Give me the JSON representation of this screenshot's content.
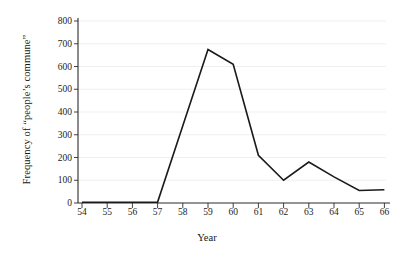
{
  "chart_data": {
    "type": "line",
    "title": "",
    "xlabel": "Year",
    "ylabel": "Frequency of “people’s commune”",
    "x": [
      54,
      55,
      56,
      57,
      58,
      59,
      60,
      61,
      62,
      63,
      64,
      65,
      66
    ],
    "categories": [
      "54",
      "55",
      "56",
      "57",
      "58",
      "59",
      "60",
      "61",
      "62",
      "63",
      "64",
      "65",
      "66"
    ],
    "values": [
      3,
      3,
      3,
      4,
      340,
      675,
      610,
      210,
      100,
      180,
      115,
      55,
      58
    ],
    "series": [
      {
        "name": "Frequency of “people’s commune”",
        "values": [
          3,
          3,
          3,
          4,
          340,
          675,
          610,
          210,
          100,
          180,
          115,
          55,
          58
        ]
      }
    ],
    "xlim": [
      53.5,
      66.6
    ],
    "ylim": [
      0,
      800
    ],
    "yticks": [
      0,
      100,
      200,
      300,
      400,
      500,
      600,
      700,
      800
    ],
    "ytick_labels": [
      "0",
      "100",
      "200",
      "300",
      "400",
      "500",
      "600",
      "700",
      "800"
    ],
    "xticks": [
      54,
      55,
      56,
      57,
      58,
      59,
      60,
      61,
      62,
      63,
      64,
      65,
      66
    ],
    "xtick_labels": [
      "54",
      "55",
      "56",
      "57",
      "58",
      "59",
      "60",
      "61",
      "62",
      "63",
      "64",
      "65",
      "66"
    ],
    "grid": true,
    "grid_axis": "y",
    "legend": false,
    "legend_position": "none",
    "line_color": "#1a1a1a",
    "grid_color": "#efefef",
    "axis_color": "#2b2b2b",
    "background": "#ffffff",
    "line_width": 1.6,
    "markers": false
  }
}
